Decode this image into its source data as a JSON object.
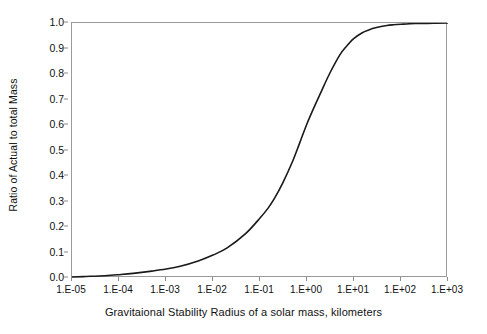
{
  "chart_data": {
    "type": "line",
    "title": "",
    "subtitle": "",
    "xlabel": "Gravitaional Stability Radius of a solar mass, kilometers",
    "ylabel": "Ratio of Actual to total Mass",
    "xscale": "log",
    "yscale": "linear",
    "xlim": [
      1e-05,
      1000
    ],
    "ylim": [
      0.0,
      1.0
    ],
    "grid": false,
    "legend": false,
    "legend_position": "none",
    "xtick_labels": [
      "1.E-05",
      "1.E-04",
      "1.E-03",
      "1.E-02",
      "1.E-01",
      "1.E+00",
      "1.E+01",
      "1.E+02",
      "1.E+03"
    ],
    "xtick_values": [
      1e-05,
      0.0001,
      0.001,
      0.01,
      0.1,
      1,
      10,
      100,
      1000
    ],
    "ytick_labels": [
      "0.0",
      "0.1",
      "0.2",
      "0.3",
      "0.4",
      "0.5",
      "0.6",
      "0.7",
      "0.8",
      "0.9",
      "1.0"
    ],
    "ytick_values": [
      0.0,
      0.1,
      0.2,
      0.3,
      0.4,
      0.5,
      0.6,
      0.7,
      0.8,
      0.9,
      1.0
    ],
    "line_color": "#1a1a1a",
    "line_width": 1.6,
    "axis_color": "#9a9a9a",
    "series": [
      {
        "name": "Ratio of Actual to total Mass",
        "x": [
          1e-05,
          2e-05,
          5e-05,
          0.0001,
          0.0002,
          0.0005,
          0.001,
          0.002,
          0.005,
          0.01,
          0.02,
          0.05,
          0.1,
          0.15,
          0.2,
          0.3,
          0.5,
          0.7,
          1.0,
          1.5,
          2.0,
          3.0,
          5.0,
          7.0,
          10.0,
          15.0,
          20.0,
          30.0,
          50.0,
          70.0,
          100.0,
          200.0,
          500.0,
          1000.0
        ],
        "y": [
          0.004,
          0.006,
          0.009,
          0.013,
          0.018,
          0.027,
          0.035,
          0.046,
          0.068,
          0.09,
          0.118,
          0.175,
          0.235,
          0.275,
          0.31,
          0.37,
          0.46,
          0.53,
          0.605,
          0.68,
          0.73,
          0.8,
          0.875,
          0.91,
          0.94,
          0.962,
          0.972,
          0.982,
          0.99,
          0.993,
          0.995,
          0.998,
          0.999,
          1.0
        ]
      }
    ]
  }
}
